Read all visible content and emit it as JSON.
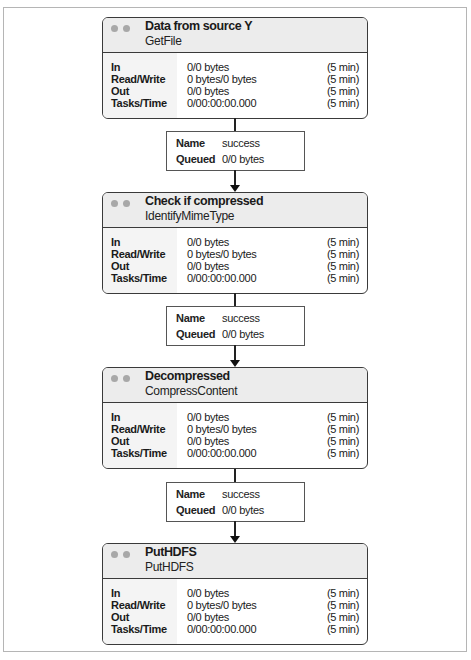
{
  "processors": [
    {
      "title": "Data from source Y",
      "type": "GetFile",
      "stats": [
        {
          "label": "In",
          "value": "0/0 bytes",
          "period": "(5 min)"
        },
        {
          "label": "Read/Write",
          "value": "0 bytes/0 bytes",
          "period": "(5 min)"
        },
        {
          "label": "Out",
          "value": "0/0 bytes",
          "period": "(5 min)"
        },
        {
          "label": "Tasks/Time",
          "value": "0/00:00:00.000",
          "period": "(5 min)"
        }
      ]
    },
    {
      "title": "Check if compressed",
      "type": "IdentifyMimeType",
      "stats": [
        {
          "label": "In",
          "value": "0/0 bytes",
          "period": "(5 min)"
        },
        {
          "label": "Read/Write",
          "value": "0 bytes/0 bytes",
          "period": "(5 min)"
        },
        {
          "label": "Out",
          "value": "0/0 bytes",
          "period": "(5 min)"
        },
        {
          "label": "Tasks/Time",
          "value": "0/00:00:00.000",
          "period": "(5 min)"
        }
      ]
    },
    {
      "title": "Decompressed",
      "type": "CompressContent",
      "stats": [
        {
          "label": "In",
          "value": "0/0 bytes",
          "period": "(5 min)"
        },
        {
          "label": "Read/Write",
          "value": "0 bytes/0 bytes",
          "period": "(5 min)"
        },
        {
          "label": "Out",
          "value": "0/0 bytes",
          "period": "(5 min)"
        },
        {
          "label": "Tasks/Time",
          "value": "0/00:00:00.000",
          "period": "(5 min)"
        }
      ]
    },
    {
      "title": "PutHDFS",
      "type": "PutHDFS",
      "stats": [
        {
          "label": "In",
          "value": "0/0 bytes",
          "period": "(5 min)"
        },
        {
          "label": "Read/Write",
          "value": "0 bytes/0 bytes",
          "period": "(5 min)"
        },
        {
          "label": "Out",
          "value": "0/0 bytes",
          "period": "(5 min)"
        },
        {
          "label": "Tasks/Time",
          "value": "0/00:00:00.000",
          "period": "(5 min)"
        }
      ]
    }
  ],
  "connections": [
    {
      "name_label": "Name",
      "name": "success",
      "queued_label": "Queued",
      "queued": "0/0 bytes"
    },
    {
      "name_label": "Name",
      "name": "success",
      "queued_label": "Queued",
      "queued": "0/0 bytes"
    },
    {
      "name_label": "Name",
      "name": "success",
      "queued_label": "Queued",
      "queued": "0/0 bytes"
    }
  ],
  "colors": {
    "header_bg": "#ececec",
    "label_col_bg": "#f4f4f4",
    "border": "#3a3a3a",
    "status_dot": "#a8a8a8"
  }
}
